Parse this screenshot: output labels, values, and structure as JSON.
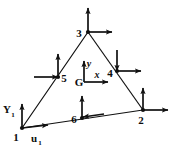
{
  "figure": {
    "background_color": "#ffffff",
    "line_color": "#111111",
    "width": 173,
    "height": 146
  },
  "element": {
    "shape": "triangle",
    "corner_nodes": [
      "1",
      "2",
      "3"
    ],
    "midside_nodes": [
      "4",
      "5",
      "6"
    ],
    "vertices": {
      "n1": {
        "x": 22,
        "y": 128
      },
      "n2": {
        "x": 143,
        "y": 110
      },
      "n3": {
        "x": 88,
        "y": 32
      }
    },
    "midsides": {
      "n4": {
        "x": 117,
        "y": 71
      },
      "n5": {
        "x": 58,
        "y": 77
      },
      "n6": {
        "x": 82,
        "y": 118
      }
    }
  },
  "nodes": [
    {
      "id": "node-1",
      "label": "1",
      "label_x": 16,
      "label_y": 140,
      "x": 22,
      "y": 128,
      "arrows": [
        "up",
        "right"
      ]
    },
    {
      "id": "node-2",
      "label": "2",
      "label_x": 140,
      "label_y": 124,
      "x": 143,
      "y": 110,
      "arrows": [
        "up",
        "right"
      ]
    },
    {
      "id": "node-3",
      "label": "3",
      "label_x": 78,
      "label_y": 36,
      "x": 88,
      "y": 32,
      "arrows": [
        "up",
        "right"
      ]
    },
    {
      "id": "node-4",
      "label": "4",
      "label_x": 110,
      "label_y": 76,
      "x": 117,
      "y": 71,
      "arrows": [
        "down",
        "right"
      ]
    },
    {
      "id": "node-5",
      "label": "5",
      "label_x": 62,
      "label_y": 81,
      "x": 58,
      "y": 77,
      "arrows": [
        "up",
        "right"
      ]
    },
    {
      "id": "node-6",
      "label": "6",
      "label_x": 72,
      "label_y": 122,
      "x": 82,
      "y": 118,
      "arrows": [
        "up",
        "left"
      ]
    }
  ],
  "axes": {
    "origin_label": "G",
    "origin_x": 84,
    "origin_y": 82,
    "x_axis_label": "x",
    "x_label_x": 99,
    "x_label_y": 78,
    "y_axis_label": "y",
    "y_label_x": 88,
    "y_label_y": 64
  },
  "dof_labels": [
    {
      "id": "displacement-y-node-1",
      "base": "Y",
      "subscript": "1",
      "base_x": 4,
      "base_y": 112,
      "sub_x": 11,
      "sub_y": 116
    },
    {
      "id": "displacement-u-node-1",
      "base": "u",
      "subscript": "1",
      "base_x": 33,
      "base_y": 142,
      "sub_x": 40,
      "sub_y": 145
    }
  ]
}
